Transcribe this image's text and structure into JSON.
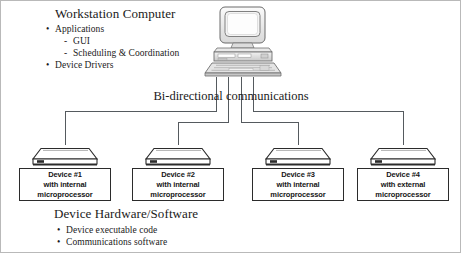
{
  "diagram": {
    "type": "network-architecture",
    "top_section": {
      "heading": "Workstation Computer",
      "bullets": [
        {
          "marker": "•",
          "text": "Applications",
          "level": 1
        },
        {
          "marker": "-",
          "text": "GUI",
          "level": 2
        },
        {
          "marker": "-",
          "text": "Scheduling & Coordination",
          "level": 2
        },
        {
          "marker": "•",
          "text": "Device Drivers",
          "level": 1
        }
      ],
      "icon": "desktop-computer-icon"
    },
    "connection_label": "Bi-directional communications",
    "devices": [
      {
        "icon": "device-hardware-icon",
        "line1": "Device #1",
        "line2": "with internal",
        "line3": "microprocessor"
      },
      {
        "icon": "device-hardware-icon",
        "line1": "Device #2",
        "line2": "with internal",
        "line3": "microprocessor"
      },
      {
        "icon": "device-hardware-icon",
        "line1": "Device #3",
        "line2": "with internal",
        "line3": "microprocessor"
      },
      {
        "icon": "device-hardware-icon",
        "line1": "Device #4",
        "line2": "with external",
        "line3": "microprocessor"
      }
    ],
    "bottom_section": {
      "heading": "Device Hardware/Software",
      "bullets": [
        {
          "marker": "•",
          "text": "Device executable code"
        },
        {
          "marker": "•",
          "text": "Communications software"
        }
      ]
    },
    "colors": {
      "line": "#555a5e",
      "box_border": "#2b2b2b",
      "text": "#1a1a1a",
      "frame": "#b9b9b9",
      "background": "#ffffff"
    }
  }
}
